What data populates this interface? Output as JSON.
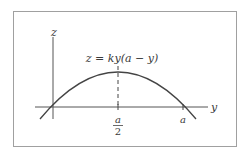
{
  "diagram": {
    "equation_label": "z = ky(a − y)",
    "axis_labels": {
      "vertical": "z",
      "horizontal": "y"
    },
    "tick_labels": {
      "half_numerator": "a",
      "half_denominator": "2",
      "end": "a"
    },
    "colors": {
      "frame": "#9a9a9a",
      "axes": "#555555",
      "curve": "#444444",
      "text": "#3a3a3a"
    }
  }
}
